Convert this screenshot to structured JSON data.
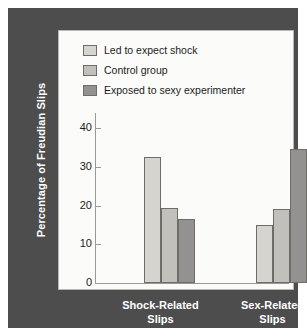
{
  "chart_data": {
    "type": "bar",
    "title": "",
    "xlabel": "",
    "ylabel": "Percentage of Freudian Slips",
    "categories": [
      "Shock-Related Slips",
      "Sex-Related Slips"
    ],
    "category_lines": [
      [
        "Shock-Related",
        "Slips"
      ],
      [
        "Sex-Related",
        "Slips"
      ]
    ],
    "series": [
      {
        "name": "Led to expect shock",
        "color": "#d6d4cf",
        "values": [
          32.5,
          15.0
        ]
      },
      {
        "name": "Control group",
        "color": "#c2c0bb",
        "values": [
          19.3,
          19.2
        ]
      },
      {
        "name": "Exposed to sexy experimenter",
        "color": "#949290",
        "values": [
          16.5,
          34.8
        ]
      }
    ],
    "ylim": [
      0,
      44
    ],
    "yticks": [
      0,
      10,
      20,
      30,
      40
    ],
    "ytick_labels": [
      "0",
      "10",
      "20",
      "30",
      "40"
    ],
    "grid": false,
    "legend_position": "top-left"
  },
  "legend": {
    "items": [
      {
        "label": "Led to expect shock",
        "color": "#d6d4cf"
      },
      {
        "label": "Control group",
        "color": "#c2c0bb"
      },
      {
        "label": "Exposed to sexy experimenter",
        "color": "#949290"
      }
    ]
  },
  "colors": {
    "frame": "#4d4d4d",
    "panel": "#fbfbf9",
    "axis": "#9b9995",
    "bar_outline": "#6e6c69",
    "label_text": "#ffffff",
    "tick_text": "#1b1b1b"
  }
}
